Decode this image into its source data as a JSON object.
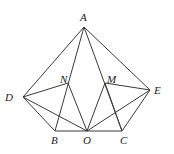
{
  "diagram": {
    "points": {
      "A": {
        "x": 84,
        "y": 27,
        "label": "A",
        "lx": 80,
        "ly": 21
      },
      "D": {
        "x": 23,
        "y": 97,
        "label": "D",
        "lx": 5,
        "ly": 101
      },
      "E": {
        "x": 150,
        "y": 90,
        "label": "E",
        "lx": 154,
        "ly": 94
      },
      "N": {
        "x": 68,
        "y": 83,
        "label": "N",
        "lx": 60,
        "ly": 83
      },
      "M": {
        "x": 105,
        "y": 83,
        "label": "M",
        "lx": 107,
        "ly": 83
      },
      "B": {
        "x": 55,
        "y": 131,
        "label": "B",
        "lx": 51,
        "ly": 144
      },
      "O": {
        "x": 87,
        "y": 131,
        "label": "O",
        "lx": 83,
        "ly": 144
      },
      "C": {
        "x": 122,
        "y": 131,
        "label": "C",
        "lx": 120,
        "ly": 144
      }
    },
    "segments": [
      [
        "A",
        "D"
      ],
      [
        "A",
        "E"
      ],
      [
        "A",
        "B"
      ],
      [
        "A",
        "C"
      ],
      [
        "D",
        "B"
      ],
      [
        "D",
        "N"
      ],
      [
        "D",
        "O"
      ],
      [
        "N",
        "O"
      ],
      [
        "M",
        "O"
      ],
      [
        "M",
        "E"
      ],
      [
        "E",
        "O"
      ],
      [
        "E",
        "C"
      ],
      [
        "B",
        "C"
      ],
      [
        "M",
        "C"
      ]
    ]
  }
}
